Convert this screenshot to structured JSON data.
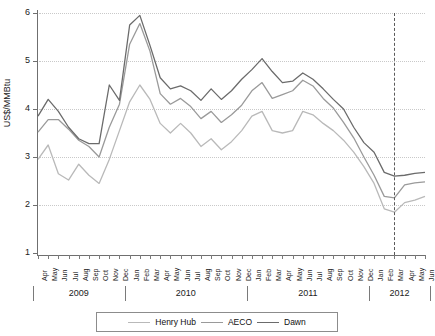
{
  "chart_data": {
    "type": "line",
    "title": "",
    "xlabel": "",
    "ylabel": "US$/MMBtu",
    "ylim": [
      1,
      6
    ],
    "yticks": [
      1,
      2,
      3,
      4,
      5,
      6
    ],
    "grid": true,
    "legend_position": "bottom",
    "x": [
      "Apr",
      "May",
      "Jun",
      "Jul",
      "Aug",
      "Sep",
      "Oct",
      "Nov",
      "Dec",
      "Jan",
      "Feb",
      "Mar",
      "Apr",
      "May",
      "Jun",
      "Jul",
      "Aug",
      "Sep",
      "Oct",
      "Nov",
      "Dec",
      "Jan",
      "Feb",
      "Mar",
      "Apr",
      "May",
      "Jun",
      "Jul",
      "Aug",
      "Sep",
      "Oct",
      "Nov",
      "Dec",
      "Jan",
      "Feb",
      "Mar",
      "Apr",
      "May",
      "Jun"
    ],
    "year_groups": [
      {
        "label": "2009",
        "start_index": 0,
        "end_index": 8
      },
      {
        "label": "2010",
        "start_index": 9,
        "end_index": 20
      },
      {
        "label": "2011",
        "start_index": 21,
        "end_index": 32
      },
      {
        "label": "2012",
        "start_index": 33,
        "end_index": 38
      }
    ],
    "annotations": [
      {
        "type": "vertical-dashed-line",
        "at_index": 35,
        "label": ""
      }
    ],
    "series": [
      {
        "name": "Henry Hub",
        "color": "#b9b9b9",
        "values": [
          2.95,
          3.25,
          2.65,
          2.52,
          2.85,
          2.62,
          2.45,
          2.95,
          3.55,
          4.15,
          4.5,
          4.2,
          3.7,
          3.5,
          3.7,
          3.5,
          3.22,
          3.38,
          3.15,
          3.32,
          3.55,
          3.85,
          3.95,
          3.55,
          3.5,
          3.55,
          3.95,
          3.88,
          3.7,
          3.55,
          3.35,
          3.1,
          2.8,
          2.45,
          1.92,
          1.85,
          2.05,
          2.1,
          2.18
        ]
      },
      {
        "name": "AECO",
        "color": "#9a9a9a",
        "values": [
          3.52,
          3.78,
          3.78,
          3.58,
          3.35,
          3.22,
          3.0,
          3.62,
          4.1,
          5.35,
          5.78,
          5.2,
          4.32,
          4.1,
          4.22,
          4.05,
          3.8,
          3.95,
          3.72,
          3.88,
          4.08,
          4.38,
          4.55,
          4.22,
          4.3,
          4.38,
          4.6,
          4.48,
          4.22,
          4.02,
          3.72,
          3.4,
          3.0,
          2.62,
          2.18,
          2.15,
          2.42,
          2.46,
          2.48
        ]
      },
      {
        "name": "Dawn",
        "color": "#6b6b6b",
        "values": [
          3.85,
          4.2,
          3.95,
          3.62,
          3.38,
          3.28,
          3.28,
          4.5,
          4.18,
          5.75,
          5.95,
          5.32,
          4.65,
          4.42,
          4.48,
          4.38,
          4.18,
          4.42,
          4.2,
          4.38,
          4.62,
          4.82,
          5.05,
          4.78,
          4.55,
          4.58,
          4.75,
          4.62,
          4.42,
          4.2,
          4.0,
          3.62,
          3.3,
          3.1,
          2.68,
          2.6,
          2.62,
          2.66,
          2.68
        ]
      }
    ]
  },
  "legend": {
    "items": [
      {
        "label": "Henry Hub",
        "color": "#b9b9b9"
      },
      {
        "label": "AECO",
        "color": "#9a9a9a"
      },
      {
        "label": "Dawn",
        "color": "#6b6b6b"
      }
    ]
  }
}
